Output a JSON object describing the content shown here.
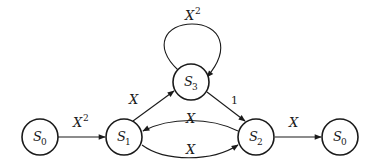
{
  "diagram": {
    "type": "state-transition-graph",
    "nodes": [
      {
        "id": "s0_in",
        "name": "S",
        "subscript": "0"
      },
      {
        "id": "s1",
        "name": "S",
        "subscript": "1"
      },
      {
        "id": "s3",
        "name": "S",
        "subscript": "3"
      },
      {
        "id": "s2",
        "name": "S",
        "subscript": "2"
      },
      {
        "id": "s0_out",
        "name": "S",
        "subscript": "0"
      }
    ],
    "edges": [
      {
        "from": "s0_in",
        "to": "s1",
        "label": "X",
        "exponent": "2"
      },
      {
        "from": "s1",
        "to": "s3",
        "label": "X",
        "exponent": ""
      },
      {
        "from": "s3",
        "to": "s3",
        "label": "X",
        "exponent": "2"
      },
      {
        "from": "s3",
        "to": "s2",
        "label": "1",
        "exponent": ""
      },
      {
        "from": "s2",
        "to": "s1",
        "label": "X",
        "exponent": ""
      },
      {
        "from": "s1",
        "to": "s2",
        "label": "X",
        "exponent": ""
      },
      {
        "from": "s2",
        "to": "s0_out",
        "label": "X",
        "exponent": ""
      }
    ]
  }
}
